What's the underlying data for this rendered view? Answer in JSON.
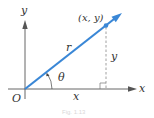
{
  "diagram": {
    "type": "polar-coordinates-vector",
    "labels": {
      "y_axis": "y",
      "x_axis": "x",
      "origin": "O",
      "point": "(x, y)",
      "radius": "r",
      "angle": "θ",
      "horizontal_leg": "x",
      "vertical_leg": "y"
    },
    "caption": "Fig. 1.13",
    "colors": {
      "vector": "#3a87d6",
      "axes": "#555555",
      "dashed": "#888888",
      "text": "#333333"
    }
  }
}
